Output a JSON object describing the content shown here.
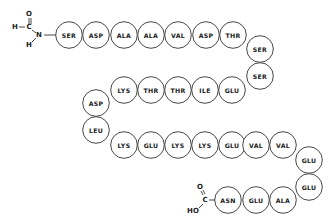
{
  "diagram": {
    "type": "peptide-chain",
    "n_terminus": {
      "group": "formyl",
      "atoms": [
        "O",
        "H",
        "C",
        "N",
        "H"
      ]
    },
    "c_terminus": {
      "group": "carboxyl",
      "atoms": [
        "O",
        "C",
        "HO"
      ]
    },
    "residues": [
      "SER",
      "ASP",
      "ALA",
      "ALA",
      "VAL",
      "ASP",
      "THR",
      "SER",
      "SER",
      "GLU",
      "ILE",
      "THR",
      "THR",
      "LYS",
      "ASP",
      "LEU",
      "LYS",
      "GLU",
      "LYS",
      "LYS",
      "GLU",
      "VAL",
      "VAL",
      "GLU",
      "GLU",
      "ALA",
      "GLU",
      "ASN"
    ]
  }
}
